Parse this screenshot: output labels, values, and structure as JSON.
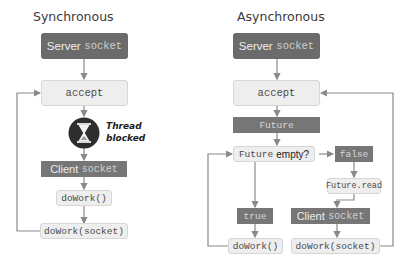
{
  "sync": {
    "title": "Synchronous",
    "server_word": "Server",
    "server_code": "socket",
    "accept": "accept",
    "thread_line1": "Thread",
    "thread_line2": "blocked",
    "client_word": "Client",
    "client_code": "socket",
    "dowork": "doWork()",
    "dowork_socket": "doWork(socket)"
  },
  "async": {
    "title": "Asynchronous",
    "server_word": "Server",
    "server_code": "socket",
    "accept": "accept",
    "future": "Future",
    "future_empty_code": "Future",
    "future_empty_text": "empty?",
    "false": "false",
    "future_read": "Future.read",
    "true": "true",
    "client_word": "Client",
    "client_code": "socket",
    "dowork": "doWork()",
    "dowork_socket": "doWork(socket)"
  },
  "colors": {
    "dark_box": "#6b6b6b",
    "light_box": "#eeeeee",
    "line": "#8a8a8a",
    "hourglass_circle": "#2e2e2e"
  }
}
